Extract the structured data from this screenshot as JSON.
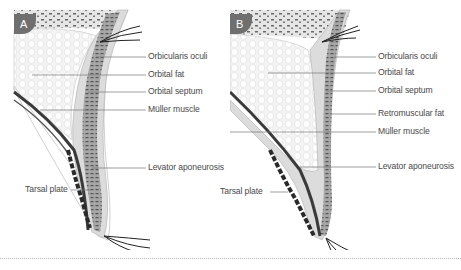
{
  "figure": {
    "panels": [
      {
        "id": "A",
        "badge": "A",
        "labels": [
          {
            "text": "Orbicularis oculi",
            "target": "orbicularis-oculi"
          },
          {
            "text": "Orbital fat",
            "target": "orbital-fat"
          },
          {
            "text": "Orbital septum",
            "target": "orbital-septum"
          },
          {
            "text": "Müller muscle",
            "target": "muller-muscle"
          },
          {
            "text": "Levator aponeurosis",
            "target": "levator-aponeurosis"
          },
          {
            "text": "Tarsal plate",
            "target": "tarsal-plate"
          }
        ]
      },
      {
        "id": "B",
        "badge": "B",
        "labels": [
          {
            "text": "Orbicularis oculi",
            "target": "orbicularis-oculi"
          },
          {
            "text": "Orbital fat",
            "target": "orbital-fat"
          },
          {
            "text": "Orbital septum",
            "target": "orbital-septum"
          },
          {
            "text": "Retromuscular fat",
            "target": "retromuscular-fat"
          },
          {
            "text": "Müller muscle",
            "target": "muller-muscle"
          },
          {
            "text": "Levator aponeurosis",
            "target": "levator-aponeurosis"
          },
          {
            "text": "Tarsal plate",
            "target": "tarsal-plate"
          }
        ]
      }
    ],
    "colors": {
      "badge": "#6f6f6f",
      "label_text": "#4a4a4a",
      "leader_line": "#777777",
      "fat": "#f2f2f2",
      "muscle": "#9a9a9a",
      "skin": "#d9d9d9",
      "tarsus": "#2a2a2a"
    }
  }
}
